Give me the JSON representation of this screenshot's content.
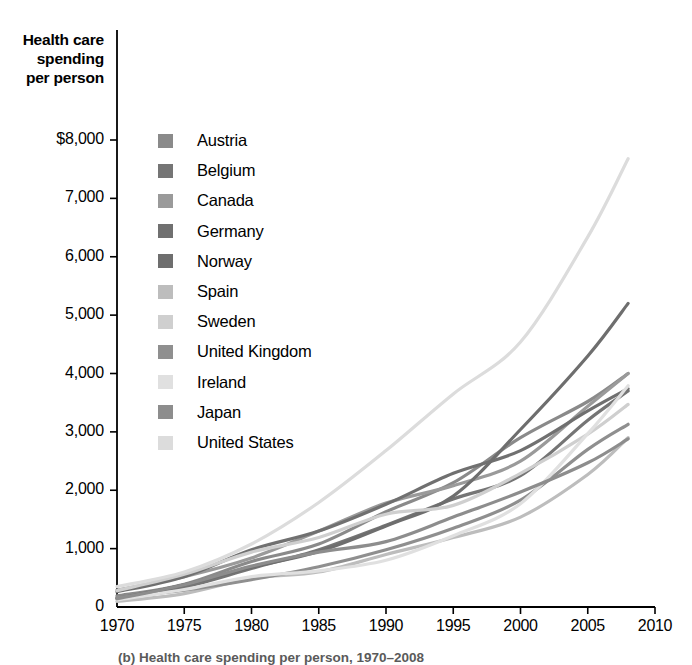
{
  "axis_title": {
    "line1": "Health care",
    "line2": "spending",
    "line3": "per person"
  },
  "caption": "(b) Health care spending per person, 1970–2008",
  "chart_data": {
    "type": "line",
    "title": "Health care spending per person",
    "xlabel": "",
    "ylabel": "Health care spending per person",
    "xlim": [
      1970,
      2010
    ],
    "ylim": [
      0,
      8000
    ],
    "grid": false,
    "legend_position": "inside-top-left",
    "xticks": [
      1970,
      1975,
      1980,
      1985,
      1990,
      1995,
      2000,
      2005,
      2010
    ],
    "xtick_labels": [
      "1970",
      "1975",
      "1980",
      "1985",
      "1990",
      "1995",
      "2000",
      "2005",
      "2010"
    ],
    "yticks": [
      0,
      1000,
      2000,
      3000,
      4000,
      5000,
      6000,
      7000,
      8000
    ],
    "ytick_labels": [
      "0",
      "1,000",
      "2,000",
      "3,000",
      "4,000",
      "5,000",
      "6,000",
      "7,000",
      "$8,000"
    ],
    "x": [
      1970,
      1975,
      1980,
      1985,
      1990,
      1995,
      2000,
      2005,
      2008
    ],
    "series": [
      {
        "name": "Austria",
        "color": "#8a8a8a",
        "values": [
          190,
          390,
          780,
          1080,
          1630,
          2130,
          2900,
          3520,
          4000
        ]
      },
      {
        "name": "Belgium",
        "color": "#757575",
        "values": [
          150,
          340,
          660,
          980,
          1400,
          1850,
          2250,
          3200,
          3700
        ]
      },
      {
        "name": "Canada",
        "color": "#9a9a9a",
        "values": [
          290,
          520,
          840,
          1300,
          1780,
          2080,
          2500,
          3440,
          4000
        ]
      },
      {
        "name": "Germany",
        "color": "#707070",
        "values": [
          260,
          520,
          980,
          1300,
          1760,
          2290,
          2680,
          3360,
          3740
        ]
      },
      {
        "name": "Norway",
        "color": "#6e6e6e",
        "values": [
          140,
          380,
          680,
          950,
          1390,
          1900,
          3040,
          4300,
          5200
        ]
      },
      {
        "name": "Spain",
        "color": "#bdbdbd",
        "values": [
          95,
          230,
          490,
          600,
          900,
          1190,
          1540,
          2270,
          2900
        ]
      },
      {
        "name": "Sweden",
        "color": "#cfcfcf",
        "values": [
          280,
          560,
          940,
          1190,
          1590,
          1740,
          2290,
          2960,
          3470
        ]
      },
      {
        "name": "United Kingdom",
        "color": "#8f8f8f",
        "values": [
          160,
          290,
          470,
          690,
          980,
          1350,
          1830,
          2700,
          3130
        ]
      },
      {
        "name": "Ireland",
        "color": "#e0e0e0",
        "values": [
          120,
          300,
          520,
          620,
          800,
          1220,
          1770,
          2970,
          3790
        ]
      },
      {
        "name": "Japan",
        "color": "#8d8d8d",
        "values": [
          140,
          380,
          700,
          940,
          1120,
          1540,
          1970,
          2470,
          2880
        ]
      },
      {
        "name": "United States",
        "color": "#dcdcdc",
        "values": [
          350,
          600,
          1080,
          1790,
          2680,
          3650,
          4540,
          6340,
          7680
        ]
      }
    ]
  }
}
